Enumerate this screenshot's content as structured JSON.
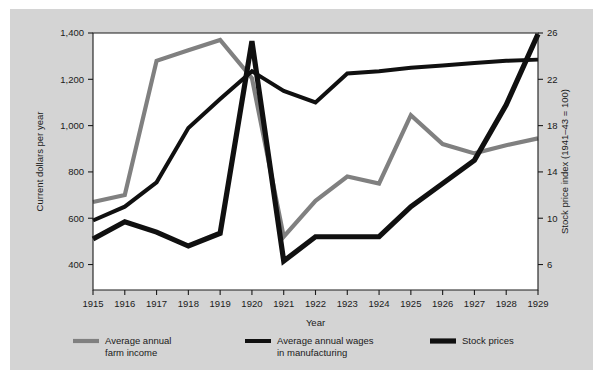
{
  "chart_data": {
    "type": "line",
    "title": "",
    "xlabel": "Year",
    "ylabel": "Current dollars per year",
    "y2label": "Stock price index (1941–43 = 100)",
    "x": [
      1915,
      1916,
      1917,
      1918,
      1919,
      1920,
      1921,
      1922,
      1923,
      1924,
      1925,
      1926,
      1927,
      1928,
      1929
    ],
    "xtick_labels": [
      "1915",
      "1916",
      "1917",
      "1918",
      "1919",
      "1920",
      "1921",
      "1922",
      "1923",
      "1924",
      "1925",
      "1926",
      "1927",
      "1928",
      "1929"
    ],
    "ytick_labels": [
      "400",
      "600",
      "800",
      "1,000",
      "1,200",
      "1,400"
    ],
    "ytick_values": [
      400,
      600,
      800,
      1000,
      1200,
      1400
    ],
    "ylim": [
      290,
      1400
    ],
    "y2tick_labels": [
      "6",
      "10",
      "14",
      "18",
      "22",
      "26"
    ],
    "y2tick_values": [
      6,
      10,
      14,
      18,
      22,
      26
    ],
    "y2lim": [
      3.8,
      26
    ],
    "grid": false,
    "legend_position": "bottom",
    "series": [
      {
        "name": "Average annual farm income",
        "legend_label_line1": "Average annual",
        "legend_label_line2": "farm income",
        "color": "#808080",
        "width": 4.2,
        "axis": "left",
        "values": [
          670,
          700,
          1280,
          1325,
          1370,
          1205,
          520,
          675,
          780,
          750,
          1045,
          920,
          880,
          915,
          945
        ]
      },
      {
        "name": "Average annual wages in manufacturing",
        "legend_label_line1": "Average annual wages",
        "legend_label_line2": "in manufacturing",
        "color": "#101010",
        "width": 4.0,
        "axis": "left",
        "values": [
          590,
          650,
          755,
          990,
          1115,
          1235,
          1150,
          1100,
          1225,
          1235,
          1250,
          1260,
          1270,
          1280,
          1285
        ]
      },
      {
        "name": "Stock prices",
        "legend_label_line1": "Stock prices",
        "legend_label_line2": "",
        "color": "#101010",
        "width": 5.2,
        "axis": "right",
        "values": [
          8.2,
          9.7,
          8.8,
          7.6,
          8.7,
          25.3,
          6.3,
          8.4,
          8.4,
          8.4,
          11.0,
          13.0,
          15.0,
          19.8,
          25.9
        ]
      }
    ]
  },
  "plot": {
    "background": "#ffffff",
    "figure_background": "#d4d4d4",
    "frame_color": "#1a1a1a"
  }
}
